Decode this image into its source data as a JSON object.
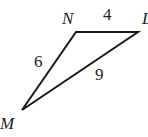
{
  "figure": {
    "type": "triangle",
    "vertices": [
      {
        "name": "N",
        "x": 76,
        "y": 32
      },
      {
        "name": "L",
        "x": 138,
        "y": 32
      },
      {
        "name": "M",
        "x": 22,
        "y": 110
      }
    ],
    "labels": {
      "vertex_n": "N",
      "vertex_l": "L",
      "vertex_m": "M",
      "side_nl": "4",
      "side_nm": "6",
      "side_ml": "9"
    },
    "stroke_color": "#1a1a1a"
  }
}
